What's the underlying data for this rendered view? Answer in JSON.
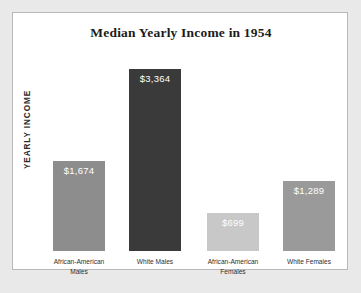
{
  "chart_data": {
    "type": "bar",
    "title": "Median Yearly Income in 1954",
    "xlabel": "",
    "ylabel": "YEARLY INCOME",
    "ylim": [
      0,
      3700
    ],
    "grid": false,
    "legend": "none",
    "categories": [
      "African-American Males",
      "White Males",
      "African-American Females",
      "White Females"
    ],
    "values": [
      1674,
      3364,
      699,
      1289
    ],
    "value_labels": [
      "$1,674",
      "$3,364",
      "$699",
      "$1,289"
    ],
    "bar_colors": [
      "#8d8d8d",
      "#3a3a3a",
      "#c8c8c8",
      "#9a9a9a"
    ],
    "bars": [
      {
        "category_line1": "African-American",
        "category_line2": "Males",
        "value": 1674,
        "value_label": "$1,674",
        "color": "#8d8d8d"
      },
      {
        "category_line1": "White Males",
        "category_line2": "",
        "value": 3364,
        "value_label": "$3,364",
        "color": "#3a3a3a"
      },
      {
        "category_line1": "African-American",
        "category_line2": "Females",
        "value": 699,
        "value_label": "$699",
        "color": "#c8c8c8"
      },
      {
        "category_line1": "White Females",
        "category_line2": "",
        "value": 1289,
        "value_label": "$1,289",
        "color": "#9a9a9a"
      }
    ]
  },
  "panel": {
    "background": "#ffffff",
    "border_color": "#b9b9b9",
    "page_background": "#e9e9e9"
  }
}
